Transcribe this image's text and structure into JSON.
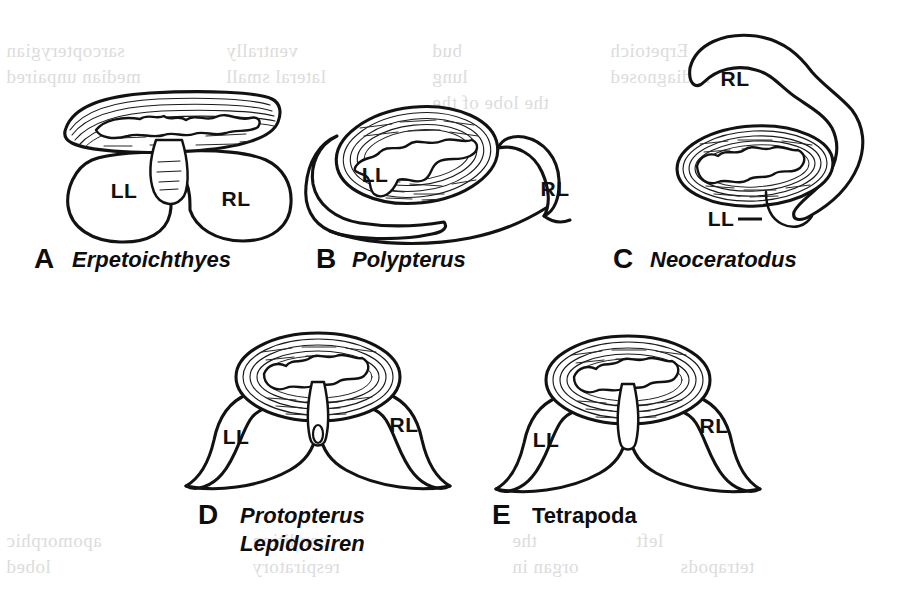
{
  "figure": {
    "kind": "comparative-anatomy-line-drawing",
    "background_color": "#ffffff",
    "ink_color": "#121212",
    "bleedthrough_color": "#cfcfcf"
  },
  "panels": [
    {
      "letter": "A",
      "name_lines": [
        "Erpetoichthyes"
      ],
      "italic": true,
      "labels": [
        {
          "text": "LL",
          "role": "left-lobe"
        },
        {
          "text": "RL",
          "role": "right-lobe"
        }
      ],
      "leader_line": false
    },
    {
      "letter": "B",
      "name_lines": [
        "Polypterus"
      ],
      "italic": true,
      "labels": [
        {
          "text": "LL",
          "role": "left-lobe"
        },
        {
          "text": "RL",
          "role": "right-lobe"
        }
      ],
      "leader_line": false
    },
    {
      "letter": "C",
      "name_lines": [
        "Neoceratodus"
      ],
      "italic": true,
      "labels": [
        {
          "text": "RL",
          "role": "right-lobe"
        },
        {
          "text": "LL",
          "role": "left-lobe"
        }
      ],
      "leader_line": true
    },
    {
      "letter": "D",
      "name_lines": [
        "Protopterus",
        "Lepidosiren"
      ],
      "italic": true,
      "labels": [
        {
          "text": "LL",
          "role": "left-lobe"
        },
        {
          "text": "RL",
          "role": "right-lobe"
        }
      ],
      "leader_line": false
    },
    {
      "letter": "E",
      "name_lines": [
        "Tetrapoda"
      ],
      "italic": false,
      "labels": [
        {
          "text": "LL",
          "role": "left-lobe"
        },
        {
          "text": "RL",
          "role": "right-lobe"
        }
      ],
      "leader_line": false
    }
  ],
  "bleedthrough": {
    "note": "faint mirrored show-through text from the reverse side of the printed page",
    "lines": [
      {
        "text": "sarcopterygian",
        "x": 6,
        "y": 40
      },
      {
        "text": "ventrally",
        "x": 226,
        "y": 40
      },
      {
        "text": "bud",
        "x": 432,
        "y": 40
      },
      {
        "text": "Erpetoich",
        "x": 610,
        "y": 40
      },
      {
        "text": "median unpaired",
        "x": 6,
        "y": 66
      },
      {
        "text": "lateral small",
        "x": 226,
        "y": 66
      },
      {
        "text": "lung",
        "x": 432,
        "y": 66
      },
      {
        "text": "is diagnosed",
        "x": 610,
        "y": 66
      },
      {
        "text": "lobe",
        "x": 226,
        "y": 92
      },
      {
        "text": "the lobe of the",
        "x": 432,
        "y": 92
      },
      {
        "text": "apomorphic",
        "x": 6,
        "y": 530
      },
      {
        "text": "condition",
        "x": 252,
        "y": 530
      },
      {
        "text": "the",
        "x": 512,
        "y": 530
      },
      {
        "text": "left",
        "x": 636,
        "y": 530
      },
      {
        "text": "lobed",
        "x": 6,
        "y": 556
      },
      {
        "text": "respiratory",
        "x": 252,
        "y": 556
      },
      {
        "text": "organ in",
        "x": 512,
        "y": 556
      },
      {
        "text": "tetrapods",
        "x": 680,
        "y": 556
      }
    ]
  }
}
